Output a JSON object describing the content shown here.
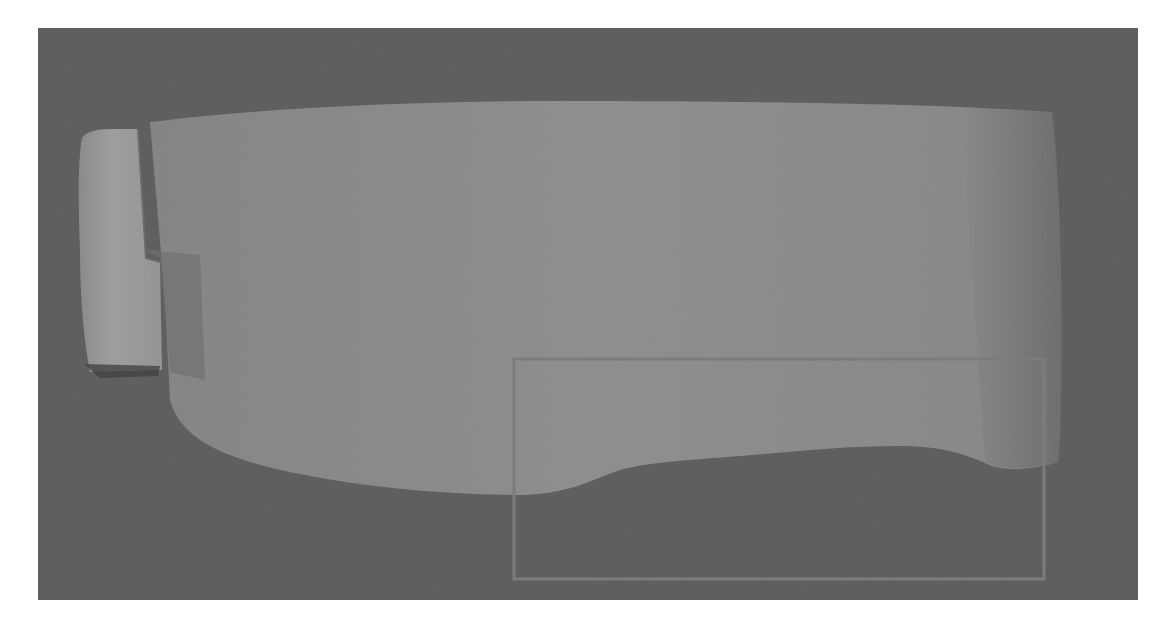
{
  "image": {
    "description": "Grayscale scanned image showing a large light-gray rounded body on a dark-gray field, a small bright block at the left edge, and a rectangular region-of-interest outline in the lower right.",
    "canvas": {
      "width": 1170,
      "height": 630,
      "background": "#ffffff"
    }
  },
  "panel": {
    "x": 38,
    "y": 28,
    "width": 1100,
    "height": 572,
    "color": "#5f5f5f"
  },
  "body_shape": {
    "color": "#8c8c8c",
    "shade_color": "#7e7e7e"
  },
  "left_block": {
    "color": "#9a9a9a",
    "shadow_color": "#3f3f3f"
  },
  "lower_region": {
    "color": "#585858"
  },
  "roi_box": {
    "x": 513,
    "y": 358,
    "width": 532,
    "height": 222,
    "stroke": "#7c7c7c",
    "label": "region-of-interest"
  },
  "colors": {
    "background_field": "#5f5f5f",
    "body": "#8c8c8c",
    "block": "#9a9a9a",
    "dark_lower": "#585858",
    "roi": "#7c7c7c"
  }
}
